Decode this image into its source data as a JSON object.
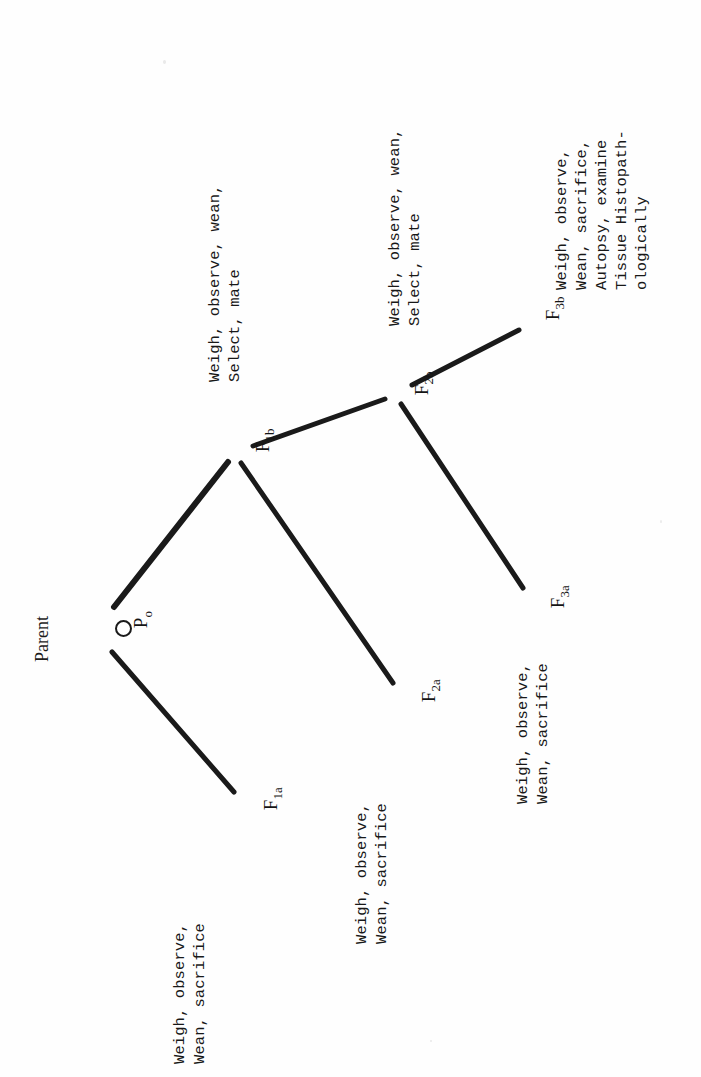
{
  "figure": {
    "kind": "breeding-study-pedigree-tree",
    "orientation": "rotated-90-ccw",
    "caption": "Parent",
    "line_color": "#1a1a1a",
    "text_color": "#181818",
    "background": "#fefefe"
  },
  "nodes": [
    {
      "id": "P0",
      "base": "P",
      "sub": "o",
      "x": 118,
      "y": 627,
      "marker": "circle"
    },
    {
      "id": "F1a",
      "base": "F",
      "sub": "1a",
      "x": 246,
      "y": 800,
      "marker": "none"
    },
    {
      "id": "F1b",
      "base": "F",
      "sub": "1b",
      "x": 240,
      "y": 443,
      "marker": "none"
    },
    {
      "id": "F2a",
      "base": "F",
      "sub": "2a",
      "x": 404,
      "y": 692,
      "marker": "none"
    },
    {
      "id": "F2b",
      "base": "F",
      "sub": "2b",
      "x": 399,
      "y": 386,
      "marker": "none"
    },
    {
      "id": "F3a",
      "base": "F",
      "sub": "3a",
      "x": 533,
      "y": 598,
      "marker": "none"
    },
    {
      "id": "F3b",
      "base": "F",
      "sub": "3b",
      "x": 528,
      "y": 310,
      "marker": "none"
    }
  ],
  "edges": [
    {
      "from": "P0",
      "to": "F1a"
    },
    {
      "from": "P0",
      "to": "F1b"
    },
    {
      "from": "F1b",
      "to": "F2a"
    },
    {
      "from": "F1b",
      "to": "F2b"
    },
    {
      "from": "F2b",
      "to": "F3a"
    },
    {
      "from": "F2b",
      "to": "F3b"
    }
  ],
  "annotations": [
    {
      "id": "annot-F1a",
      "for": "F1a",
      "lines": [
        "Weigh, observe,",
        "Wean, sacrifice"
      ],
      "text": "Weigh, observe,\nWean, sacrifice"
    },
    {
      "id": "annot-F1b",
      "for": "F1b",
      "lines": [
        "Weigh, observe, wean,",
        "Select, mate"
      ],
      "text": "Weigh, observe, wean,\nSelect, mate"
    },
    {
      "id": "annot-F2a",
      "for": "F2a",
      "lines": [
        "Weigh, observe,",
        "Wean, sacrifice"
      ],
      "text": "Weigh, observe,\nWean, sacrifice"
    },
    {
      "id": "annot-F2b",
      "for": "F2b",
      "lines": [
        "Weigh, observe, wean,",
        "Select, mate"
      ],
      "text": "Weigh, observe, wean,\nSelect, mate"
    },
    {
      "id": "annot-F3a",
      "for": "F3a",
      "lines": [
        "Weigh, observe,",
        "Wean, sacrifice"
      ],
      "text": "Weigh, observe,\nWean, sacrifice"
    },
    {
      "id": "annot-F3b",
      "for": "F3b",
      "lines": [
        "Weigh, observe,",
        "Wean, sacrifice,",
        "Autopsy, examine",
        "Tissue Histopath-",
        "ologically"
      ],
      "text": "Weigh, observe,\nWean, sacrifice,\nAutopsy, examine\nTissue Histopath-\nologically"
    }
  ]
}
